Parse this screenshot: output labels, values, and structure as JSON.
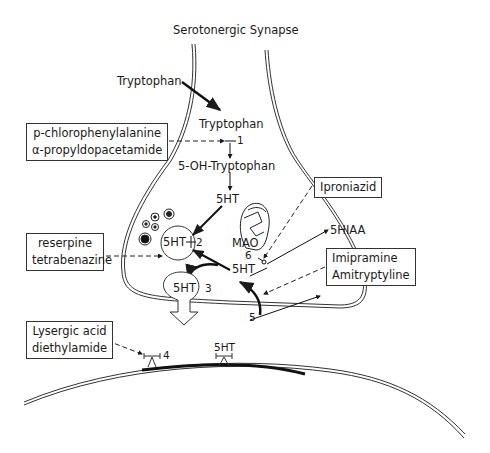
{
  "title": "Serotonergic Synapse",
  "pathway": {
    "tryptophan_outside": "Tryptophan",
    "tryptophan_inside": "Tryptophan",
    "hydroxy": "5-OH-Tryptophan",
    "serotonin_cytoplasm": "5HT",
    "serotonin_vesicle": "5HT",
    "serotonin_reuptake": "5HT",
    "serotonin_release": "5HT",
    "serotonin_receptor": "5HT",
    "mao": "MAO",
    "metabolite": "5HIAA"
  },
  "steps": [
    "1",
    "2",
    "3",
    "4",
    "5",
    "6"
  ],
  "drugs": {
    "synthesis_inhibitors": [
      "p-chlorophenylalanine",
      "α-propyldopacetamide"
    ],
    "vesicle_inhibitors": [
      "reserpine",
      "tetrabenazine"
    ],
    "mao_inhibitor": "Iproniazid",
    "reuptake_inhibitors": [
      "Imipramine",
      "Amitryptyline"
    ],
    "receptor_blocker": [
      "Lysergic acid",
      "diethylamide"
    ]
  }
}
